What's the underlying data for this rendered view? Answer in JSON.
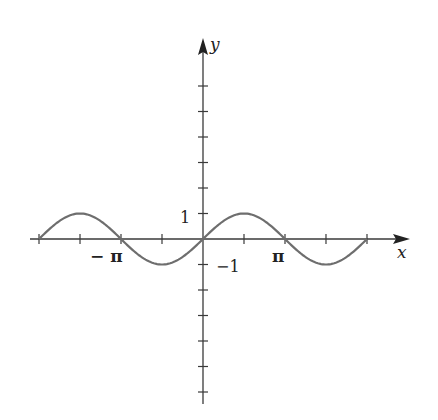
{
  "chart_data": {
    "type": "line",
    "title": "",
    "function": "y = sin(x)",
    "xlabel": "x",
    "ylabel": "y",
    "xlim": [
      -6.283,
      6.283
    ],
    "ylim": [
      -1,
      1
    ],
    "x_tick_step": "π/2",
    "x_ticks": [
      -6.283,
      -4.712,
      -3.1416,
      -1.5708,
      0,
      1.5708,
      3.1416,
      4.712,
      6.283
    ],
    "x_tick_labels": [
      {
        "value": -3.1416,
        "label": "−π"
      },
      {
        "value": 3.1416,
        "label": "π"
      }
    ],
    "y_ticks": [
      -6,
      -5,
      -4,
      -3,
      -2,
      -1,
      1,
      2,
      3,
      4,
      5,
      6
    ],
    "y_tick_labels": [
      {
        "value": 1,
        "label": "1"
      },
      {
        "value": -1,
        "label": "−1"
      }
    ],
    "series": [
      {
        "name": "sin(x)",
        "x": [
          -6.283,
          -4.712,
          -3.1416,
          -1.5708,
          0,
          1.5708,
          3.1416,
          4.712,
          6.283
        ],
        "values": [
          0,
          1,
          0,
          -1,
          0,
          1,
          0,
          -1,
          0
        ]
      }
    ],
    "grid": false,
    "legend": null
  },
  "labels": {
    "x_axis": "x",
    "y_axis": "y",
    "neg_pi": "− π",
    "pi": "π",
    "one": "1",
    "neg_one": "−1"
  },
  "colors": {
    "axis": "#3a3a3a",
    "curve": "#6e6e6e"
  }
}
